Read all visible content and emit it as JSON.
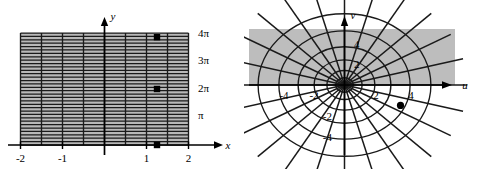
{
  "figure": {
    "type": "two-panel-math-figure"
  },
  "colors": {
    "ink": "#000000",
    "grid_line": "#1a1a1a",
    "shade_fill": "#b8b8b8",
    "shade_fill_right": "#bdbdbd",
    "background": "#ffffff"
  },
  "left_panel": {
    "axes": {
      "x_axis_label": "x",
      "y_axis_label": "y"
    },
    "x_ticks": [
      {
        "label": "-2",
        "value": -2
      },
      {
        "label": "-1",
        "value": -1
      },
      {
        "label": "1",
        "value": 1
      },
      {
        "label": "2",
        "value": 2
      }
    ],
    "y_ticks": [
      {
        "label": "π",
        "value": 1
      },
      {
        "label": "2π",
        "value": 2
      },
      {
        "label": "3π",
        "value": 3
      },
      {
        "label": "4π",
        "value": 4
      }
    ],
    "region": {
      "x_min": -2,
      "x_max": 2,
      "y_min": 0,
      "y_max": 4
    },
    "vertical_gridlines_x": [
      -2,
      -1.5,
      -1,
      -0.5,
      0,
      0.5,
      1,
      1.5,
      2
    ],
    "horizontal_gridline_count": 33,
    "points": [
      {
        "x": 1.25,
        "y": 3.85
      },
      {
        "x": 1.25,
        "y": 2.0
      },
      {
        "x": 1.25,
        "y": 0.0
      }
    ]
  },
  "right_panel": {
    "axes": {
      "u_axis_label": "u",
      "v_axis_label": "v"
    },
    "u_ticks": [
      {
        "label": "-4",
        "value": -4
      },
      {
        "label": "-2",
        "value": -2
      },
      {
        "label": "2",
        "value": 2
      },
      {
        "label": "4",
        "value": 4
      }
    ],
    "v_ticks": [
      {
        "label": "4",
        "value": 4
      },
      {
        "label": "2",
        "value": 2
      },
      {
        "label": "-2",
        "value": -2
      },
      {
        "label": "-4",
        "value": -4
      }
    ],
    "shaded_rect": {
      "u_min": -5.4,
      "u_max": 5.4,
      "v_min": 0,
      "v_max": 5.4
    },
    "circle_radii": [
      0.55,
      1.1,
      1.9,
      2.9,
      4.1,
      5.4
    ],
    "ray_count": 24,
    "points": [
      {
        "u": 3.5,
        "v": -1.55
      }
    ]
  }
}
